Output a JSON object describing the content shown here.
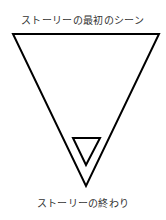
{
  "diagram": {
    "top_label": "ストーリーの最初のシーン",
    "bottom_label": "ストーリーの終わり",
    "shapes": [
      {
        "name": "outer-triangle",
        "type": "inverted-triangle",
        "points": [
          [
            13,
            34
          ],
          [
            159,
            34
          ],
          [
            86,
            186
          ]
        ],
        "stroke": "#000000"
      },
      {
        "name": "inner-triangle",
        "type": "inverted-triangle",
        "points": [
          [
            73,
            138
          ],
          [
            100,
            138
          ],
          [
            86,
            165
          ]
        ],
        "stroke": "#000000"
      }
    ]
  }
}
